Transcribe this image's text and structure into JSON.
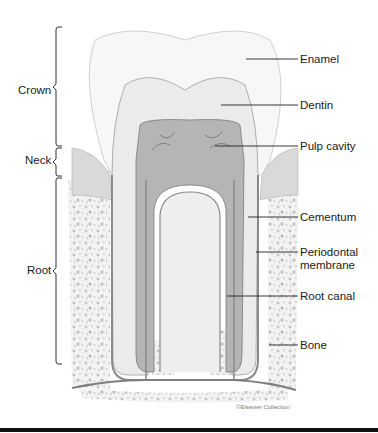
{
  "diagram": {
    "regions": [
      {
        "label": "Crown",
        "bracket_top": 27,
        "bracket_bottom": 146
      },
      {
        "label": "Neck",
        "bracket_top": 146,
        "bracket_bottom": 177
      },
      {
        "label": "Root",
        "bracket_top": 177,
        "bracket_bottom": 364
      }
    ],
    "structures": [
      {
        "label": "Enamel"
      },
      {
        "label": "Dentin"
      },
      {
        "label": "Pulp cavity"
      },
      {
        "label": "Cementum"
      },
      {
        "label": "Periodontal membrane"
      },
      {
        "label": "Root canal"
      },
      {
        "label": "Bone"
      }
    ],
    "credit": "©Elsevier Collection",
    "colors": {
      "enamel": "#f6f6f6",
      "dentin": "#e9e9e9",
      "pulp": "#9a9a9a",
      "gum": "#d6d6d6",
      "bone": "#f0f0f0",
      "bone_speckle": "#bdbdbd",
      "outline": "#7a7a7a",
      "leader": "#222222"
    }
  }
}
